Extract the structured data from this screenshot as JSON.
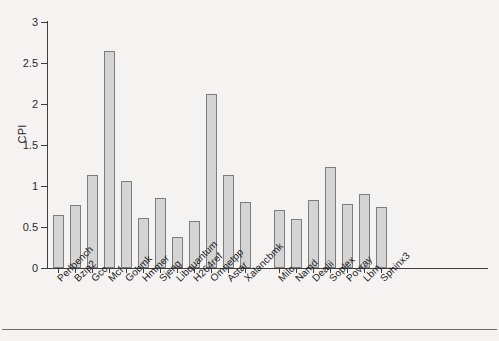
{
  "chart_data": {
    "type": "bar",
    "title": "",
    "xlabel": "",
    "ylabel": "CPI",
    "ylim": [
      0,
      3
    ],
    "yticks": [
      0,
      0.5,
      1,
      1.5,
      2,
      2.5,
      3
    ],
    "ytick_labels": [
      "0",
      "0.5",
      "1",
      "1.5",
      "2",
      "2.5",
      "3"
    ],
    "grid": false,
    "legend": null,
    "categories": [
      "Perlbench",
      "Bzip2",
      "Gcc",
      "Mcf",
      "Gobmk",
      "Hmmer",
      "Sjeng",
      "Libquantum",
      "H264ref",
      "Omnetpp",
      "Astar",
      "Xalancbmk",
      "Milc",
      "Namd",
      "Dealii",
      "Soplex",
      "Povray",
      "Lbm",
      "Sphinx3"
    ],
    "values": [
      0.65,
      0.77,
      1.13,
      2.65,
      1.06,
      0.61,
      0.85,
      0.38,
      0.57,
      2.12,
      1.13,
      0.8,
      0.71,
      0.6,
      0.83,
      1.23,
      0.78,
      0.9,
      0.75
    ],
    "gap_after_index": 11,
    "bar_color": "#d4d4d4",
    "bar_edge_color": "#7d7d7d",
    "axis_color": "#3d3d3d",
    "background_color": "#f4f3f1"
  }
}
